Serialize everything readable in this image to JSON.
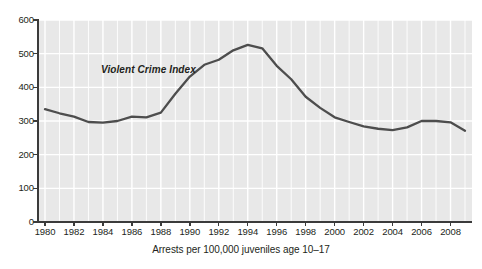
{
  "chart_data": {
    "type": "line",
    "title": "",
    "subtitle": "",
    "xlabel": "Arrests per 100,000 juveniles age 10–17",
    "ylabel": "",
    "xlim": [
      1980,
      2009
    ],
    "ylim": [
      0,
      600
    ],
    "grid": true,
    "grid_color": "#ffffff",
    "plot_background": "#e8e8e8",
    "line_color": "#4d4d4d",
    "legend": "none",
    "annotations": [
      {
        "text": "Violent Crime Index",
        "x": 1984.5,
        "y": 430,
        "style": "bold-italic"
      }
    ],
    "series": [
      {
        "name": "Violent Crime Index",
        "x": [
          1980,
          1981,
          1982,
          1983,
          1984,
          1985,
          1986,
          1987,
          1988,
          1989,
          1990,
          1991,
          1992,
          1993,
          1994,
          1995,
          1996,
          1997,
          1998,
          1999,
          2000,
          2001,
          2002,
          2003,
          2004,
          2005,
          2006,
          2007,
          2008,
          2009
        ],
        "values": [
          335,
          323,
          313,
          297,
          295,
          300,
          313,
          311,
          325,
          381,
          432,
          467,
          482,
          510,
          526,
          516,
          464,
          424,
          372,
          339,
          311,
          297,
          284,
          277,
          273,
          281,
          300,
          300,
          296,
          271
        ]
      }
    ],
    "y_ticks": [
      0,
      100,
      200,
      300,
      400,
      500,
      600
    ],
    "y_tick_labels": [
      "0",
      "100",
      "200",
      "300",
      "400",
      "500",
      "600"
    ],
    "x_ticks": [
      1980,
      1982,
      1984,
      1986,
      1988,
      1990,
      1992,
      1994,
      1996,
      1998,
      2000,
      2002,
      2004,
      2006,
      2008
    ],
    "x_tick_labels": [
      "1980",
      "1982",
      "1984",
      "1986",
      "1988",
      "1990",
      "1992",
      "1994",
      "1996",
      "1998",
      "2000",
      "2002",
      "2004",
      "2006",
      "2008"
    ]
  }
}
